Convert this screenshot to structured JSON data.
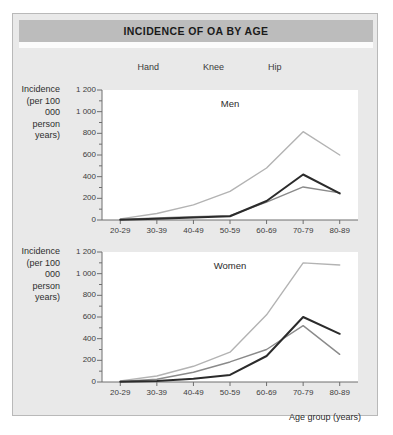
{
  "figure": {
    "title": "INCIDENCE OF OA BY AGE",
    "x_axis_title": "Age group (years)",
    "y_axis_title": "Incidence\n(per 100 000\nperson years)",
    "colors": {
      "hand": "#b3b3b3",
      "knee": "#8a8a8a",
      "hip": "#2b2b2b",
      "title_bar": "#bcbcbc",
      "panel_background": "#e9e9e9",
      "plot_background": "#ffffff",
      "axis": "#6e6e6e"
    }
  },
  "legend": {
    "position": "top-center",
    "items": [
      {
        "label": "Hand",
        "color": "#b3b3b3"
      },
      {
        "label": "Knee",
        "color": "#8a8a8a"
      },
      {
        "label": "Hip",
        "color": "#2b2b2b"
      }
    ]
  },
  "chart_data": [
    {
      "type": "line",
      "title": "Men",
      "xlabel": "",
      "ylabel": "Incidence (per 100 000 person years)",
      "categories": [
        "20-29",
        "30-39",
        "40-49",
        "50-59",
        "60-69",
        "70-79",
        "80-89"
      ],
      "ytick_labels": [
        "0",
        "200",
        "400",
        "600",
        "800",
        "1 000",
        "1 200"
      ],
      "ytick_values": [
        0,
        200,
        400,
        600,
        800,
        1000,
        1200
      ],
      "ylim": [
        0,
        1200
      ],
      "grid": false,
      "minor_ticks": true,
      "series": [
        {
          "name": "Hand",
          "color": "#b3b3b3",
          "values": [
            10,
            60,
            140,
            265,
            480,
            815,
            600
          ]
        },
        {
          "name": "Knee",
          "color": "#8a8a8a",
          "values": [
            5,
            20,
            30,
            40,
            165,
            305,
            250
          ]
        },
        {
          "name": "Hip",
          "color": "#2b2b2b",
          "values": [
            3,
            12,
            22,
            35,
            175,
            420,
            245
          ]
        }
      ]
    },
    {
      "type": "line",
      "title": "Women",
      "xlabel": "Age group (years)",
      "ylabel": "Incidence (per 100 000 person years)",
      "categories": [
        "20-29",
        "30-39",
        "40-49",
        "50-59",
        "60-69",
        "70-79",
        "80-89"
      ],
      "ytick_labels": [
        "0",
        "200",
        "400",
        "600",
        "800",
        "1 000",
        "1 200"
      ],
      "ytick_values": [
        0,
        200,
        400,
        600,
        800,
        1000,
        1200
      ],
      "ylim": [
        0,
        1200
      ],
      "grid": false,
      "minor_ticks": true,
      "series": [
        {
          "name": "Hand",
          "color": "#b3b3b3",
          "values": [
            10,
            55,
            145,
            275,
            620,
            1100,
            1080
          ]
        },
        {
          "name": "Knee",
          "color": "#8a8a8a",
          "values": [
            5,
            25,
            90,
            185,
            300,
            520,
            255
          ]
        },
        {
          "name": "Hip",
          "color": "#2b2b2b",
          "values": [
            3,
            10,
            30,
            65,
            240,
            600,
            445
          ]
        }
      ]
    }
  ]
}
